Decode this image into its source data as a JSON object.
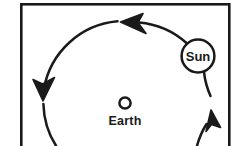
{
  "figure": {
    "background_color": "#ffffff",
    "stroke_color": "#1a1a1a",
    "frame": {
      "name": "figure-border",
      "x": 21,
      "y": 4,
      "width": 209,
      "height": 150,
      "stroke_width": 2.6,
      "cropped_at_bottom": true
    },
    "orbit": {
      "name": "sun-orbit-path",
      "shape": "circle",
      "center_x": 125,
      "center_y": 103,
      "radius": 82,
      "stroke_width": 2.4,
      "direction": "counterclockwise",
      "dashed": false
    },
    "bodies": [
      {
        "id": "sun",
        "label": "Sun",
        "shape": "circle-outline",
        "center_x": 198,
        "center_y": 56,
        "radius": 16.5,
        "stroke_width": 2.4,
        "label_inside": true
      },
      {
        "id": "earth",
        "label": "Earth",
        "shape": "circle-outline",
        "center_x": 125,
        "center_y": 103,
        "radius": 6,
        "stroke_width": 2.4,
        "label_inside": false,
        "label_position": "below"
      }
    ],
    "arrows": [
      {
        "id": "arrow-top",
        "points": "left",
        "tip_x": 122,
        "tip_y": 22,
        "angle_deg": 192
      },
      {
        "id": "arrow-left",
        "points": "down",
        "tip_x": 43,
        "tip_y": 97,
        "angle_deg": 102
      },
      {
        "id": "arrow-right",
        "points": "up",
        "tip_x": 210,
        "tip_y": 112,
        "angle_deg": 300
      }
    ]
  }
}
